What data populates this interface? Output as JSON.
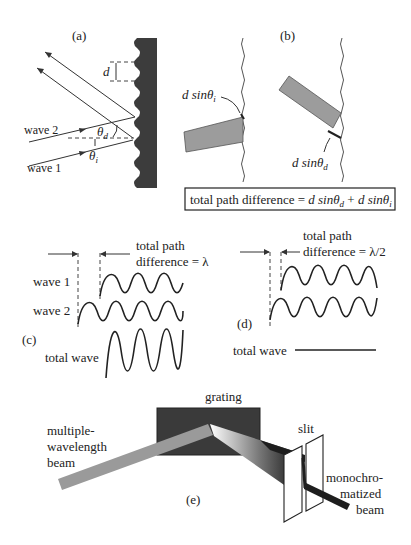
{
  "panels": {
    "a": {
      "label": "(a)",
      "spacing_label": "d",
      "wave2_label": "wave 2",
      "wave1_label": "wave 1",
      "theta_d": "θ",
      "theta_d_sub": "d",
      "theta_i": "θ",
      "theta_i_sub": "i"
    },
    "b": {
      "label": "(b)",
      "dsin_i": "d sinθ",
      "dsin_i_sub": "i",
      "dsin_d": "d sinθ",
      "dsin_d_sub": "d",
      "equation": {
        "prefix": "total path difference = ",
        "term1": "d sinθ",
        "term1_sub": "d",
        "plus": " + ",
        "term2": "d sinθ",
        "term2_sub": "i"
      }
    },
    "c": {
      "label": "(c)",
      "path_line1": "total path",
      "path_line2": "difference = λ",
      "wave1_label": "wave 1",
      "wave2_label": "wave 2",
      "total_label": "total wave"
    },
    "d": {
      "label": "(d)",
      "path_line1": "total path",
      "path_line2": "difference = λ/2",
      "total_label": "total wave"
    },
    "e": {
      "label": "(e)",
      "grating_label": "grating",
      "beam_line1": "multiple-",
      "beam_line2": "wavelength",
      "beam_line3": "beam",
      "slit_label": "slit",
      "mono_line1": "monochro-",
      "mono_line2": "matized",
      "mono_line3": "beam"
    }
  },
  "colors": {
    "grating_dark": "#3a3a3a",
    "beam_gray": "#9a9a9a",
    "beam_dark": "#1e1e1e",
    "panel_b_bar": "#9c9c9c"
  }
}
